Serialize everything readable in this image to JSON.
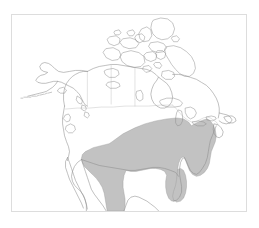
{
  "figure": {
    "caption": "Distribution map",
    "caption_visible": false,
    "width": 259,
    "height": 228,
    "background_color": "#ffffff"
  },
  "frame": {
    "x": 11,
    "y": 14,
    "width": 236,
    "height": 198,
    "border_color": "#dddddd",
    "fill_color": "#ffffff"
  },
  "map": {
    "title": "",
    "region": "North America",
    "projection_note": "",
    "landmasses": [
      "Alaska",
      "Canada",
      "Canadian Arctic Archipelago",
      "Contiguous United States",
      "Mexico"
    ],
    "coastline_color": "#8d8d8d",
    "political_border_color": "#c3c3c3",
    "land_fill_color": "#ffffff"
  },
  "range_overlay": {
    "label": "",
    "fill_color": "#c2c2c2",
    "outline_color": "#9a9a9a",
    "coverage_description": "Eastern and southeastern United States extending south into eastern Mexico",
    "states_covered": [
      "Florida",
      "Georgia",
      "Alabama",
      "Mississippi",
      "Louisiana",
      "Texas",
      "Arkansas",
      "Tennessee",
      "Kentucky",
      "Missouri",
      "Illinois",
      "Indiana",
      "Ohio",
      "West Virginia",
      "Virginia",
      "North Carolina",
      "South Carolina",
      "Maryland",
      "Delaware",
      "New Jersey",
      "Pennsylvania",
      "Oklahoma",
      "Kansas",
      "Iowa"
    ]
  },
  "legend": {
    "visible": false,
    "entries": []
  },
  "scale_bar": {
    "visible": false,
    "label": ""
  }
}
